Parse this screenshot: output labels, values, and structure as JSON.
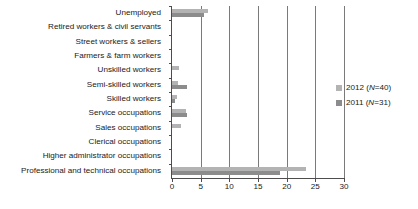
{
  "chart_data": {
    "type": "bar",
    "orientation": "horizontal",
    "title": "",
    "xlabel": "",
    "ylabel": "",
    "xlim": [
      0,
      30
    ],
    "xticks": [
      0,
      5,
      10,
      15,
      20,
      25,
      30
    ],
    "grid": true,
    "legend_position": "right",
    "categories": [
      "Unemployed",
      "Retired workers & civil servants",
      "Street workers & sellers",
      "Farmers & farm workers",
      "Unskilled workers",
      "Semi-skilled workers",
      "Skilled workers",
      "Service occupations",
      "Sales occupations",
      "Clerical occupations",
      "Higher administrator occupations",
      "Professional and technical occupations"
    ],
    "series": [
      {
        "name": "2012 (N=40)",
        "color": "#b3b3b3",
        "values": [
          6.2,
          0,
          0,
          0,
          1.2,
          1.0,
          0.9,
          2.5,
          1.5,
          0,
          0,
          23.4
        ]
      },
      {
        "name": "2011 (N=31)",
        "color": "#8c8c8c",
        "values": [
          5.5,
          0,
          0,
          0,
          0,
          2.6,
          0.6,
          2.6,
          0,
          0,
          0,
          18.8
        ]
      }
    ]
  },
  "legend": {
    "items": [
      {
        "label": "2012 (N=40)",
        "swatch": "s2012"
      },
      {
        "label": "2011 (N=31)",
        "swatch": "s2011"
      }
    ]
  },
  "axis": {
    "tick_labels": [
      "0",
      "5",
      "10",
      "15",
      "20",
      "25",
      "30"
    ]
  }
}
